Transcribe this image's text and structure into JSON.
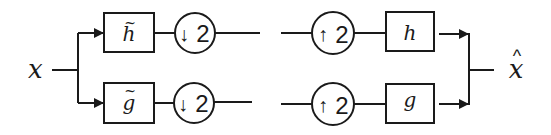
{
  "diagram": {
    "type": "two-channel filter bank",
    "input": {
      "label": "x"
    },
    "output": {
      "label": "x̂",
      "base": "x",
      "accent": "^"
    },
    "analysis": {
      "top_filter": {
        "label": "h",
        "accent": "~"
      },
      "bottom_filter": {
        "label": "g",
        "accent": "~"
      },
      "top_downsampler": {
        "arrow": "↓",
        "factor": "2"
      },
      "bottom_downsampler": {
        "arrow": "↓",
        "factor": "2"
      }
    },
    "synthesis": {
      "top_upsampler": {
        "arrow": "↑",
        "factor": "2"
      },
      "bottom_upsampler": {
        "arrow": "↑",
        "factor": "2"
      },
      "top_filter": {
        "label": "h"
      },
      "bottom_filter": {
        "label": "g"
      }
    },
    "colors": {
      "ink": "#1a1a1a",
      "background": "#ffffff"
    }
  }
}
